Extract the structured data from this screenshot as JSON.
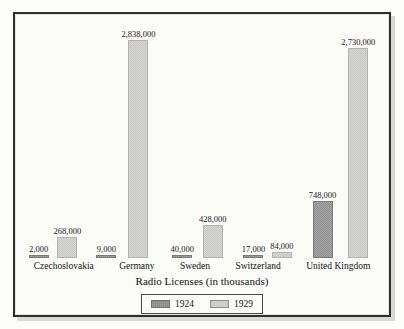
{
  "figure": {
    "background_color": "#fdfdfb",
    "frame_color": "#2e2e2e",
    "axis_title": "Radio Licenses (in thousands)"
  },
  "legend": {
    "position": "bottom-center",
    "entries": [
      {
        "label": "1924",
        "color": "#8d8d8d",
        "swatch_name": "legend-swatch-1924"
      },
      {
        "label": "1929",
        "color": "#cdcdcb",
        "swatch_name": "legend-swatch-1929"
      }
    ]
  },
  "chart_data": {
    "type": "bar",
    "title": "",
    "xlabel": "Radio Licenses (in thousands)",
    "ylabel": "",
    "ylim": [
      0,
      2838000
    ],
    "grid": false,
    "legend_position": "bottom-center",
    "categories": [
      "Czechoslovakia",
      "Germany",
      "Sweden",
      "Switzerland",
      "United Kingdom"
    ],
    "series": [
      {
        "name": "1924",
        "color": "#8d8d8d",
        "values": [
          2000,
          9000,
          40000,
          17000,
          748000
        ],
        "labels": [
          "2,000",
          "9,000",
          "40,000",
          "17,000",
          "748,000"
        ]
      },
      {
        "name": "1929",
        "color": "#c6c6c4",
        "values": [
          268000,
          2838000,
          428000,
          84000,
          2730000
        ],
        "labels": [
          "268,000",
          "2,838,000",
          "428,000",
          "84,000",
          "2,730,000"
        ]
      }
    ]
  }
}
